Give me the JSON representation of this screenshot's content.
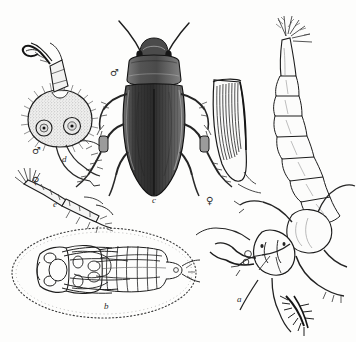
{
  "plate": {
    "title": "Diving beetle life history plate",
    "background_color": "#fdfdfc",
    "ink_color": "#2a2a2a",
    "width": 356,
    "height": 342
  },
  "figures": [
    {
      "key": "a",
      "label": "a",
      "name": "larva",
      "description": "Aquatic beetle larva, curved segmented abdomen with caudal filaments, head capsule with sickle mandibles and legs",
      "label_x": 237,
      "label_y": 301
    },
    {
      "key": "b",
      "label": "b",
      "name": "pupa",
      "description": "Pupa lying in an oval earthen cell outlined with stippled dots",
      "label_x": 104,
      "label_y": 308
    },
    {
      "key": "c",
      "label": "c",
      "name": "adult-male-beetle",
      "description": "Adult male diving beetle seen from above, smooth elytra, long antennae",
      "label_x": 152,
      "label_y": 202,
      "sex": "male"
    },
    {
      "key": "d",
      "label": "d",
      "name": "male-foreleg-sucker",
      "description": "Male foreleg tarsus enlarged into a round adhesive sucker disc bearing cupules",
      "label_x": 62,
      "label_y": 161,
      "sex": "male"
    },
    {
      "key": "e",
      "label": "e",
      "name": "female-foreleg",
      "description": "Female foreleg, slender tarsus without sucker disc",
      "label_x": 53,
      "label_y": 206,
      "sex": "female"
    },
    {
      "key": "f",
      "label": "",
      "name": "female-elytron",
      "description": "Female elytron showing deep longitudinal grooves",
      "label_x": 0,
      "label_y": 0,
      "sex": "female"
    }
  ],
  "sex_marks": [
    {
      "name": "male-symbol-beetle",
      "glyph": "♂",
      "x": 110,
      "y": 68
    },
    {
      "name": "male-symbol-sucker",
      "glyph": "♂",
      "x": 32,
      "y": 146
    },
    {
      "name": "female-symbol-leg",
      "glyph": "♀",
      "x": 32,
      "y": 176
    },
    {
      "name": "female-symbol-elytron",
      "glyph": "♀",
      "x": 206,
      "y": 196
    }
  ],
  "artifacts": {
    "top_edge_speckles": true
  }
}
